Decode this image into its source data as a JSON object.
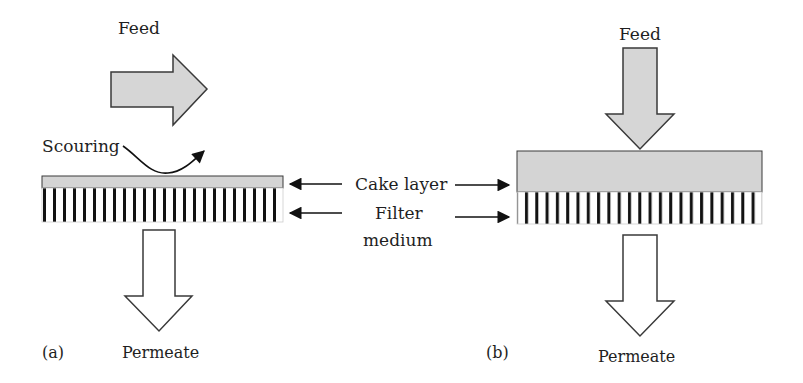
{
  "panel_a": {
    "panel_label": "(a)",
    "feed_label": "Feed",
    "scouring_label": "Scouring",
    "permeate_label": "Permeate",
    "feed_direction": "cross-flow (parallel to surface)"
  },
  "panel_b": {
    "panel_label": "(b)",
    "feed_label": "Feed",
    "permeate_label": "Permeate",
    "feed_direction": "dead-end (perpendicular to surface)"
  },
  "center_labels": {
    "cake_layer": "Cake layer",
    "filter_line1": "Filter",
    "filter_line2": "medium"
  },
  "colors": {
    "cake_fill": "#d4d4d4",
    "outline": "#3a3a3a",
    "stripe": "#111111",
    "permeate_fill": "#ffffff",
    "feed_fill": "#d6d6d6"
  }
}
